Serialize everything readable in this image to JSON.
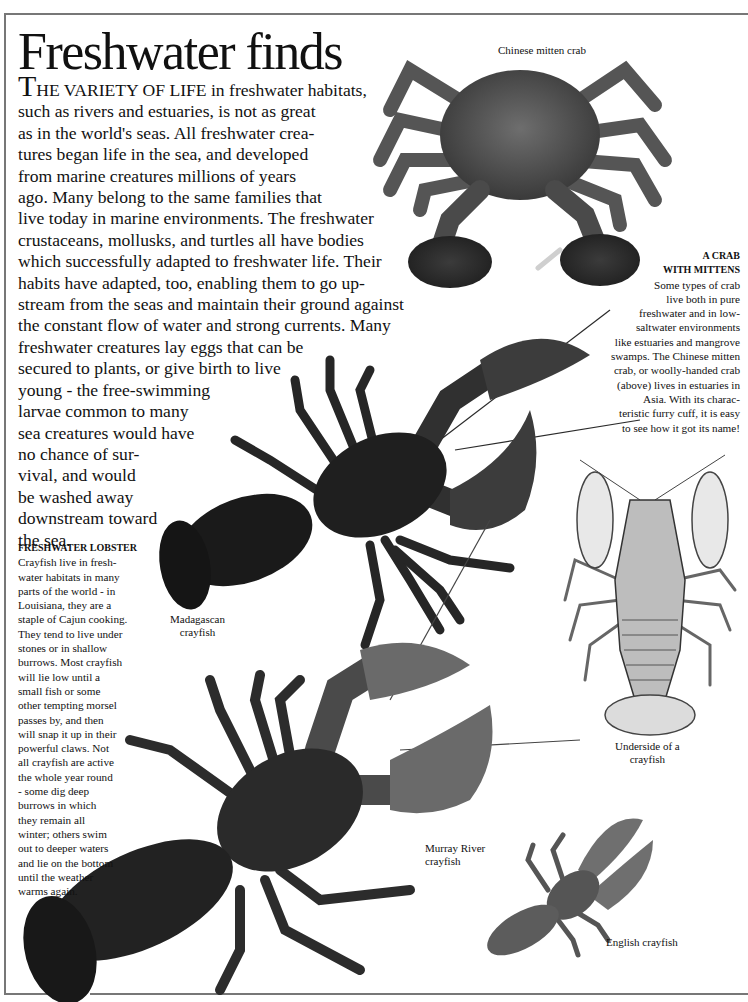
{
  "page": {
    "title": "Freshwater finds",
    "intro": {
      "dropcap": "T",
      "smallcaps_lead": "HE VARIETY OF LIFE",
      "lines": [
        " in freshwater habitats,",
        "such as rivers and estuaries, is not as great",
        "as in the world's seas. All freshwater crea-",
        "tures began life in the sea, and developed",
        "from marine creatures millions of years",
        "ago.  Many belong to the same families that",
        "live today in marine environments. The freshwater",
        "crustaceans, mollusks, and turtles all have bodies",
        "which successfully adapted to freshwater life. Their",
        "habits have adapted, too, enabling them to go up-",
        "stream from the seas and maintain their ground against",
        "the constant flow of water and strong currents. Many",
        "freshwater creatures lay eggs that can be",
        "secured to plants, or give birth to live",
        "young - the  free-swimming",
        "larvae common to many",
        "sea creatures would have",
        "no chance of sur-",
        "vival, and would",
        "be washed away",
        "downstream toward",
        "the sea."
      ]
    },
    "crab_caption": {
      "heading_lines": [
        "A CRAB",
        "WITH MITTENS"
      ],
      "lines": [
        "Some types of crab",
        "live both in pure",
        "freshwater and in low-",
        "saltwater environments",
        "like estuaries and mangrove",
        "swamps.  The Chinese mitten",
        "crab, or woolly-handed crab",
        "(above) lives in estuaries in",
        "Asia.  With its charac-",
        "teristic furry cuff, it is easy",
        "to see how it got its name!"
      ]
    },
    "lobster_caption": {
      "heading": "FRESHWATER LOBSTER",
      "lines": [
        "Crayfish live in fresh-",
        "water habitats in many",
        "parts of the world - in",
        "Louisiana, they are a",
        "staple of Cajun cooking.",
        "They tend to live under",
        "stones or in shallow",
        "burrows.  Most crayfish",
        "will lie low until a",
        "small fish or some",
        "other tempting morsel",
        "passes by,  and then",
        "will snap it up in their",
        "powerful claws. Not",
        "all crayfish are active",
        "the whole year round",
        "- some dig deep",
        "burrows in which",
        "they remain all",
        "winter; others swim",
        "out to deeper waters",
        "and lie on the bottom",
        "until the weather",
        "warms again."
      ]
    },
    "image_labels": {
      "chinese_mitten_crab": "Chinese mitten crab",
      "madagascan_crayfish": [
        "Madagascan",
        "crayfish"
      ],
      "underside_crayfish": [
        "Underside of a",
        "crayfish"
      ],
      "murray_river_crayfish": [
        "Murray River",
        "crayfish"
      ],
      "english_crayfish": "English crayfish"
    }
  }
}
